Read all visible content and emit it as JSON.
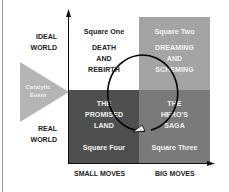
{
  "diagram": {
    "y_axis_labels": {
      "top": [
        "IDEAL",
        "WORLD"
      ],
      "bottom": [
        "REAL",
        "WORLD"
      ]
    },
    "x_axis_labels": {
      "left": "SMALL MOVES",
      "right": "BIG MOVES"
    },
    "catalyst": {
      "lines": [
        "Catalytic",
        "Event"
      ],
      "color": "#b5b5b5"
    },
    "quadrants": {
      "top_left": {
        "label": "Square One",
        "text": [
          "DEATH",
          "AND",
          "REBIRTH"
        ],
        "color": "#ffffff"
      },
      "top_right": {
        "label": "Square Two",
        "text": [
          "DREAMING",
          "AND",
          "SCHEMING"
        ],
        "color": "#a4a4a4"
      },
      "bottom_right": {
        "label": "Square Three",
        "text": [
          "THE",
          "HERO'S",
          "SAGA"
        ],
        "color": "#7a7a7a"
      },
      "bottom_left": {
        "label": "Square Four",
        "text": [
          "THE",
          "PROMISED",
          "LAND"
        ],
        "color": "#4f4f4f"
      }
    },
    "cycle": {
      "direction": "clockwise",
      "shape": "circle-arrow"
    }
  }
}
